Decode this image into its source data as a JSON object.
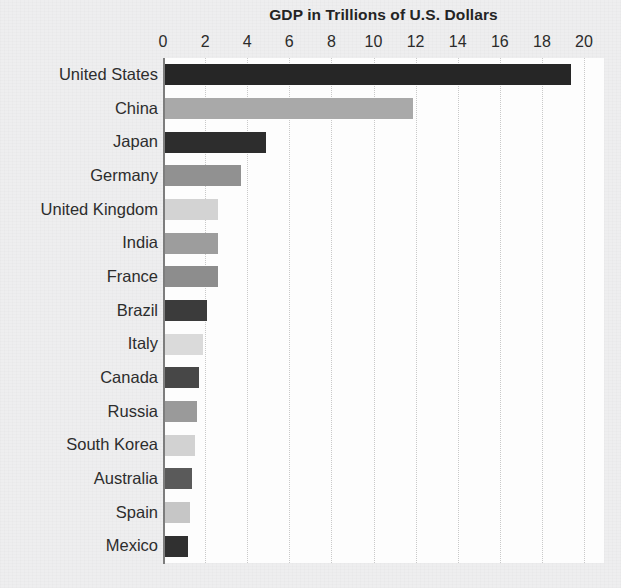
{
  "chart_data": {
    "type": "bar",
    "orientation": "horizontal",
    "title": "GDP in Trillions of U.S. Dollars",
    "xlabel": "",
    "ylabel": "",
    "xlim": [
      0,
      20
    ],
    "ylim": null,
    "grid": true,
    "grid_axis": "x",
    "grid_style": "dotted",
    "legend": false,
    "xticks": [
      0,
      2,
      4,
      6,
      8,
      10,
      12,
      14,
      16,
      18,
      20
    ],
    "xtick_labels": [
      "0",
      "2",
      "4",
      "6",
      "8",
      "10",
      "12",
      "14",
      "16",
      "18",
      "20"
    ],
    "categories": [
      "United States",
      "China",
      "Japan",
      "Germany",
      "United Kingdom",
      "India",
      "France",
      "Brazil",
      "Italy",
      "Canada",
      "Russia",
      "South Korea",
      "Australia",
      "Spain",
      "Mexico"
    ],
    "values": [
      19.4,
      11.9,
      4.9,
      3.7,
      2.6,
      2.6,
      2.6,
      2.1,
      1.9,
      1.7,
      1.6,
      1.5,
      1.4,
      1.3,
      1.2
    ],
    "bar_colors": [
      "#262626",
      "#a9a9a9",
      "#2d2d2d",
      "#919191",
      "#d3d3d3",
      "#9d9d9d",
      "#8d8d8d",
      "#3b3b3b",
      "#dadada",
      "#474747",
      "#9a9a9a",
      "#d2d2d2",
      "#5a5a5a",
      "#c6c6c6",
      "#303030"
    ],
    "plot_background": "#fdfdfd",
    "page_background": "#eeeeef",
    "axis_color": "#7d7d7d",
    "text_color": "#2b2b2b"
  }
}
